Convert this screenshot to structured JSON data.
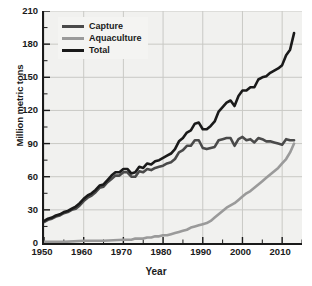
{
  "chart_data": {
    "type": "line",
    "title": "",
    "xlabel": "Year",
    "ylabel": "Million metric tons",
    "xlim": [
      1950,
      2015
    ],
    "ylim": [
      0,
      210
    ],
    "xticks": [
      1950,
      1960,
      1970,
      1980,
      1990,
      2000,
      2010
    ],
    "yticks": [
      0,
      30,
      60,
      90,
      120,
      150,
      180,
      210
    ],
    "minor_x_step": 5,
    "minor_y_step": 15,
    "grid": true,
    "legend_position": "top-left",
    "series": [
      {
        "name": "Capture",
        "color": "#4a4a4a",
        "x": [
          1950,
          1951,
          1952,
          1953,
          1954,
          1955,
          1956,
          1957,
          1958,
          1959,
          1960,
          1961,
          1962,
          1963,
          1964,
          1965,
          1966,
          1967,
          1968,
          1969,
          1970,
          1971,
          1972,
          1973,
          1974,
          1975,
          1976,
          1977,
          1978,
          1979,
          1980,
          1981,
          1982,
          1983,
          1984,
          1985,
          1986,
          1987,
          1988,
          1989,
          1990,
          1991,
          1992,
          1993,
          1994,
          1995,
          1996,
          1997,
          1998,
          1999,
          2000,
          2001,
          2002,
          2003,
          2004,
          2005,
          2006,
          2007,
          2008,
          2009,
          2010,
          2011,
          2012,
          2013
        ],
        "values": [
          19,
          21,
          22,
          24,
          25,
          27,
          28,
          30,
          31,
          34,
          38,
          41,
          43,
          46,
          50,
          51,
          55,
          58,
          61,
          61,
          64,
          64,
          60,
          60,
          65,
          64,
          67,
          66,
          68,
          69,
          70,
          72,
          73,
          76,
          82,
          84,
          88,
          88,
          93,
          93,
          86,
          85,
          86,
          87,
          93,
          94,
          95,
          95,
          88,
          94,
          96,
          93,
          94,
          91,
          95,
          94,
          92,
          92,
          91,
          90,
          89,
          94,
          93,
          93
        ]
      },
      {
        "name": "Aquaculture",
        "color": "#9a9a9a",
        "x": [
          1950,
          1955,
          1960,
          1965,
          1970,
          1971,
          1972,
          1973,
          1974,
          1975,
          1976,
          1977,
          1978,
          1979,
          1980,
          1981,
          1982,
          1983,
          1984,
          1985,
          1986,
          1987,
          1988,
          1989,
          1990,
          1991,
          1992,
          1993,
          1994,
          1995,
          1996,
          1997,
          1998,
          1999,
          2000,
          2001,
          2002,
          2003,
          2004,
          2005,
          2006,
          2007,
          2008,
          2009,
          2010,
          2011,
          2012,
          2013
        ],
        "values": [
          1,
          1,
          2,
          2,
          3,
          3,
          3,
          4,
          4,
          4,
          5,
          5,
          6,
          6,
          7,
          7,
          8,
          9,
          10,
          11,
          12,
          14,
          15,
          16,
          17,
          18,
          20,
          23,
          26,
          29,
          32,
          34,
          36,
          39,
          42,
          45,
          47,
          50,
          53,
          56,
          59,
          62,
          65,
          68,
          72,
          76,
          82,
          90
        ]
      },
      {
        "name": "Total",
        "color": "#1a1a1a",
        "x": [
          1950,
          1951,
          1952,
          1953,
          1954,
          1955,
          1956,
          1957,
          1958,
          1959,
          1960,
          1961,
          1962,
          1963,
          1964,
          1965,
          1966,
          1967,
          1968,
          1969,
          1970,
          1971,
          1972,
          1973,
          1974,
          1975,
          1976,
          1977,
          1978,
          1979,
          1980,
          1981,
          1982,
          1983,
          1984,
          1985,
          1986,
          1987,
          1988,
          1989,
          1990,
          1991,
          1992,
          1993,
          1994,
          1995,
          1996,
          1997,
          1998,
          1999,
          2000,
          2001,
          2002,
          2003,
          2004,
          2005,
          2006,
          2007,
          2008,
          2009,
          2010,
          2011,
          2012,
          2013
        ],
        "values": [
          20,
          22,
          23,
          25,
          26,
          28,
          29,
          31,
          33,
          36,
          40,
          43,
          45,
          48,
          52,
          53,
          57,
          61,
          64,
          64,
          67,
          67,
          63,
          64,
          69,
          68,
          72,
          71,
          74,
          75,
          77,
          79,
          81,
          85,
          92,
          95,
          100,
          102,
          108,
          109,
          103,
          103,
          106,
          110,
          119,
          123,
          127,
          129,
          124,
          133,
          138,
          138,
          141,
          141,
          148,
          150,
          151,
          154,
          156,
          158,
          161,
          170,
          175,
          190
        ]
      }
    ],
    "legend": [
      {
        "label": "Capture",
        "color": "#4a4a4a"
      },
      {
        "label": "Aquaculture",
        "color": "#9a9a9a"
      },
      {
        "label": "Total",
        "color": "#1a1a1a"
      }
    ]
  }
}
